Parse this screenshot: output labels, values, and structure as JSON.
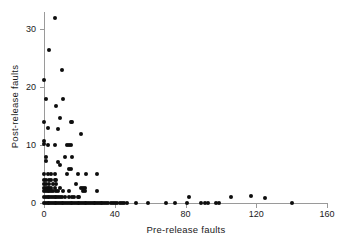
{
  "chart_data": {
    "type": "scatter",
    "title": "",
    "xlabel": "Pre-release faults",
    "ylabel": "Post-release faults",
    "xlim": [
      0,
      160
    ],
    "ylim": [
      0,
      33
    ],
    "xticks": [
      0,
      40,
      80,
      120,
      160
    ],
    "yticks": [
      0,
      10,
      20,
      30
    ],
    "grid": false,
    "legend": null,
    "marker": "filled-circle",
    "marker_color": "#0d0d0d",
    "axis_color": "#9a9a9a",
    "background": "#ffffff",
    "points": [
      [
        6,
        32
      ],
      [
        3,
        26.5
      ],
      [
        10,
        23
      ],
      [
        0,
        21.2
      ],
      [
        1,
        18
      ],
      [
        11,
        18
      ],
      [
        7,
        16.7
      ],
      [
        0,
        14
      ],
      [
        9,
        14.7
      ],
      [
        15,
        14
      ],
      [
        16,
        14
      ],
      [
        2,
        13
      ],
      [
        8,
        12.7
      ],
      [
        21,
        12
      ],
      [
        0,
        10.7
      ],
      [
        0,
        10.2
      ],
      [
        2,
        10
      ],
      [
        6,
        10
      ],
      [
        13,
        10
      ],
      [
        14,
        10
      ],
      [
        15,
        10
      ],
      [
        1,
        8
      ],
      [
        12,
        8
      ],
      [
        16,
        8
      ],
      [
        1,
        7.2
      ],
      [
        8,
        7
      ],
      [
        9,
        6.5
      ],
      [
        14,
        5.8
      ],
      [
        15,
        5.8
      ],
      [
        0,
        5
      ],
      [
        2,
        5
      ],
      [
        4,
        5
      ],
      [
        6,
        5
      ],
      [
        13,
        5
      ],
      [
        19,
        5
      ],
      [
        24,
        5
      ],
      [
        30,
        5
      ],
      [
        0,
        4
      ],
      [
        1,
        4
      ],
      [
        3,
        4
      ],
      [
        4,
        4
      ],
      [
        6,
        4
      ],
      [
        7,
        4
      ],
      [
        0,
        3.2
      ],
      [
        1,
        3.2
      ],
      [
        3,
        3.2
      ],
      [
        5,
        3.2
      ],
      [
        7,
        3.2
      ],
      [
        18,
        3.2
      ],
      [
        0,
        2.6
      ],
      [
        1,
        2.6
      ],
      [
        2,
        2.6
      ],
      [
        3,
        2.6
      ],
      [
        4,
        2.6
      ],
      [
        6,
        2.6
      ],
      [
        9,
        2.6
      ],
      [
        21,
        2.6
      ],
      [
        22,
        2.6
      ],
      [
        23,
        2.6
      ],
      [
        0,
        2
      ],
      [
        1,
        2
      ],
      [
        2,
        2
      ],
      [
        3,
        2
      ],
      [
        4,
        2
      ],
      [
        5,
        2
      ],
      [
        7,
        2
      ],
      [
        8,
        2
      ],
      [
        11,
        2
      ],
      [
        14,
        2
      ],
      [
        22,
        2
      ],
      [
        23,
        2
      ],
      [
        30,
        2
      ],
      [
        0,
        1
      ],
      [
        1,
        1
      ],
      [
        2,
        1
      ],
      [
        3,
        1
      ],
      [
        4,
        1
      ],
      [
        5,
        1
      ],
      [
        6,
        1
      ],
      [
        7,
        1
      ],
      [
        8,
        1
      ],
      [
        9,
        1
      ],
      [
        10,
        1
      ],
      [
        12,
        1
      ],
      [
        14,
        1
      ],
      [
        16,
        1
      ],
      [
        17,
        1
      ],
      [
        19,
        1
      ],
      [
        20,
        1
      ],
      [
        0,
        0
      ],
      [
        1,
        0
      ],
      [
        2,
        0
      ],
      [
        3,
        0
      ],
      [
        4,
        0
      ],
      [
        5,
        0
      ],
      [
        6,
        0
      ],
      [
        7,
        0
      ],
      [
        8,
        0
      ],
      [
        9,
        0
      ],
      [
        10,
        0
      ],
      [
        11,
        0
      ],
      [
        12,
        0
      ],
      [
        13,
        0
      ],
      [
        14,
        0
      ],
      [
        15,
        0
      ],
      [
        16,
        0
      ],
      [
        17,
        0
      ],
      [
        18,
        0
      ],
      [
        19,
        0
      ],
      [
        20,
        0
      ],
      [
        21,
        0
      ],
      [
        22,
        0
      ],
      [
        23,
        0
      ],
      [
        24,
        0
      ],
      [
        25,
        0
      ],
      [
        26,
        0
      ],
      [
        27,
        0
      ],
      [
        28,
        0
      ],
      [
        29,
        0
      ],
      [
        30,
        0
      ],
      [
        31,
        0
      ],
      [
        32,
        0
      ],
      [
        33,
        0
      ],
      [
        34,
        0
      ],
      [
        35,
        0
      ],
      [
        36,
        0
      ],
      [
        38,
        0
      ],
      [
        39,
        0
      ],
      [
        40,
        0
      ],
      [
        41,
        0
      ],
      [
        43,
        0
      ],
      [
        44,
        0
      ],
      [
        45,
        0
      ],
      [
        47,
        0
      ],
      [
        52,
        0
      ],
      [
        59,
        0
      ],
      [
        69,
        0
      ],
      [
        74,
        0
      ],
      [
        81,
        0
      ],
      [
        82,
        1
      ],
      [
        89,
        0
      ],
      [
        91,
        0
      ],
      [
        93,
        0
      ],
      [
        97,
        0
      ],
      [
        99,
        0
      ],
      [
        106,
        1
      ],
      [
        117,
        1.2
      ],
      [
        125,
        0.8
      ],
      [
        140,
        0
      ]
    ]
  }
}
